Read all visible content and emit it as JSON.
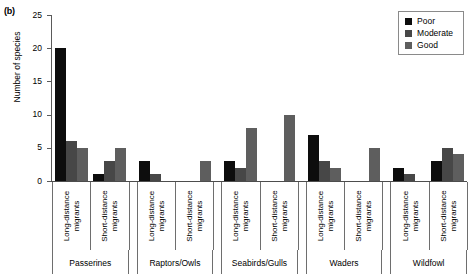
{
  "panel": {
    "label": "(b)"
  },
  "legend": {
    "position": "top-right",
    "entries": [
      {
        "label": "Poor",
        "color": "#0d0d0d"
      },
      {
        "label": "Moderate",
        "color": "#474747"
      },
      {
        "label": "Good",
        "color": "#5e5e5e"
      }
    ]
  },
  "axes": {
    "ylabel": "Number of species",
    "yticks": [
      0,
      5,
      10,
      15,
      20,
      25
    ],
    "ylim": [
      0,
      25
    ],
    "xlabel": "",
    "grid": false
  },
  "chart_data": {
    "type": "bar",
    "title": "",
    "subtitle": "",
    "xlabel": "",
    "ylabel": "Number of species",
    "ylim": [
      0,
      25
    ],
    "yticks": [
      0,
      5,
      10,
      15,
      20,
      25
    ],
    "grid": false,
    "legend_position": "top-right",
    "groups": [
      "Passerines",
      "Raptors/Owls",
      "Seabirds/Gulls",
      "Waders",
      "Wildfowl"
    ],
    "subgroups": [
      "Long-distance migrants",
      "Short-distance migrants"
    ],
    "categories": [
      "Passerines / Long-distance migrants",
      "Passerines / Short-distance migrants",
      "Raptors/Owls / Long-distance migrants",
      "Raptors/Owls / Short-distance migrants",
      "Seabirds/Gulls / Long-distance migrants",
      "Seabirds/Gulls / Short-distance migrants",
      "Waders / Long-distance migrants",
      "Waders / Short-distance migrants",
      "Wildfowl / Long-distance migrants",
      "Wildfowl / Short-distance migrants"
    ],
    "series": [
      {
        "name": "Poor",
        "color": "#0d0d0d",
        "values": [
          20,
          1,
          3,
          0,
          3,
          0,
          7,
          0,
          2,
          3
        ]
      },
      {
        "name": "Moderate",
        "color": "#474747",
        "values": [
          6,
          3,
          1,
          0,
          2,
          0,
          3,
          0,
          1,
          5
        ]
      },
      {
        "name": "Good",
        "color": "#5e5e5e",
        "values": [
          5,
          5,
          0,
          3,
          8,
          10,
          2,
          5,
          0,
          4
        ]
      }
    ]
  }
}
